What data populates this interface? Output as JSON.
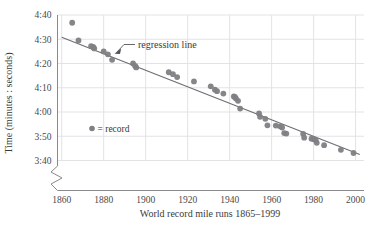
{
  "chart_data": {
    "type": "scatter",
    "title": "",
    "xlabel": "World record mile runs 1865–1999",
    "ylabel": "Time (minutes : seconds)",
    "xlim": [
      1858,
      2004
    ],
    "ylim": [
      212,
      282
    ],
    "xticks": [
      1860,
      1880,
      1900,
      1920,
      1940,
      1960,
      1980,
      2000
    ],
    "xticklabels": [
      "1860",
      "1880",
      "1900",
      "1920",
      "1940",
      "1960",
      "1980",
      "2000"
    ],
    "yticks": [
      220,
      230,
      240,
      250,
      260,
      270,
      280
    ],
    "yticklabels": [
      "3:40",
      "3:50",
      "4:00",
      "4:10",
      "4:20",
      "4:30",
      "4:40"
    ],
    "grid": true,
    "axis_break": "y-axis broken below 3:40",
    "legend": {
      "position": "inside-left",
      "marker_label": "= record"
    },
    "annotations": [
      {
        "text": "regression line",
        "points_to_series": "regression",
        "x_text": 1896,
        "y_text": 271
      }
    ],
    "series": [
      {
        "name": "record",
        "type": "scatter",
        "color": "#7f7f84",
        "marker": "circle",
        "points": [
          [
            1865,
            276.8
          ],
          [
            1868,
            269.5
          ],
          [
            1874,
            267.2
          ],
          [
            1875,
            266.8
          ],
          [
            1875.5,
            266.2
          ],
          [
            1880,
            265.0
          ],
          [
            1882,
            263.8
          ],
          [
            1884,
            261.5
          ],
          [
            1894,
            260.0
          ],
          [
            1895,
            259.0
          ],
          [
            1895.5,
            258.4
          ],
          [
            1911,
            256.4
          ],
          [
            1913,
            255.6
          ],
          [
            1915,
            254.4
          ],
          [
            1923,
            252.6
          ],
          [
            1931,
            250.6
          ],
          [
            1933,
            249.2
          ],
          [
            1934,
            248.6
          ],
          [
            1937,
            247.6
          ],
          [
            1942,
            246.4
          ],
          [
            1942.5,
            246.2
          ],
          [
            1943,
            245.6
          ],
          [
            1944,
            244.6
          ],
          [
            1945,
            241.4
          ],
          [
            1954,
            239.4
          ],
          [
            1954.5,
            238.0
          ],
          [
            1957,
            237.2
          ],
          [
            1958,
            234.5
          ],
          [
            1962,
            234.4
          ],
          [
            1964,
            234.1
          ],
          [
            1965,
            233.6
          ],
          [
            1966,
            231.3
          ],
          [
            1967,
            231.1
          ],
          [
            1975,
            231.0
          ],
          [
            1975.5,
            229.4
          ],
          [
            1979,
            229.0
          ],
          [
            1980,
            228.8
          ],
          [
            1981,
            228.4
          ],
          [
            1981.5,
            227.3
          ],
          [
            1985,
            226.3
          ],
          [
            1993,
            224.4
          ],
          [
            1999,
            223.1
          ]
        ]
      },
      {
        "name": "regression",
        "type": "line",
        "color": "#6e6e73",
        "endpoints": [
          [
            1860,
            270.8
          ],
          [
            2002,
            222.5
          ]
        ],
        "slope_per_year": -0.34,
        "intercept_at_1860": 270.8
      }
    ]
  },
  "axes": {
    "y_label": "Time (minutes : seconds)",
    "x_label": "World record mile runs 1865–1999",
    "y_tick_labels": [
      "4:40",
      "4:30",
      "4:20",
      "4:10",
      "4:00",
      "3:50",
      "3:40"
    ],
    "x_tick_labels": [
      "1860",
      "1880",
      "1900",
      "1920",
      "1940",
      "1960",
      "1980",
      "2000"
    ]
  },
  "legend": {
    "text": "= record"
  },
  "annotation": {
    "regression_label": "regression line"
  },
  "colors": {
    "marker": "#7f7f84",
    "line": "#6e6e73",
    "grid": "#e3e3e6",
    "axis": "#8a8a8e",
    "text": "#3a3a3a"
  }
}
